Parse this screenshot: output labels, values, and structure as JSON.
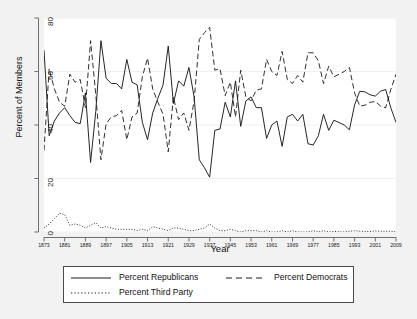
{
  "chart_data": {
    "type": "line",
    "title": "",
    "xlabel": "Year",
    "ylabel": "Percent of Members",
    "xlim": [
      1873,
      2009
    ],
    "ylim": [
      0,
      80
    ],
    "xticks": [
      1873,
      1881,
      1889,
      1897,
      1905,
      1913,
      1921,
      1929,
      1937,
      1945,
      1953,
      1961,
      1969,
      1977,
      1985,
      1993,
      2001,
      2009
    ],
    "yticks": [
      0,
      20,
      40,
      60,
      80
    ],
    "grid": "horizontal",
    "legend_position": "bottom",
    "x": [
      1873,
      1875,
      1877,
      1879,
      1881,
      1883,
      1885,
      1887,
      1889,
      1891,
      1893,
      1895,
      1897,
      1899,
      1901,
      1903,
      1905,
      1907,
      1909,
      1911,
      1913,
      1915,
      1917,
      1919,
      1921,
      1923,
      1925,
      1927,
      1929,
      1931,
      1933,
      1935,
      1937,
      1939,
      1941,
      1943,
      1945,
      1947,
      1949,
      1951,
      1953,
      1955,
      1957,
      1959,
      1961,
      1963,
      1965,
      1967,
      1969,
      1971,
      1973,
      1975,
      1977,
      1979,
      1981,
      1983,
      1985,
      1987,
      1989,
      1991,
      1993,
      1995,
      1997,
      1999,
      2001,
      2003,
      2005,
      2007,
      2009
    ],
    "series": [
      {
        "name": "Percent Republicans",
        "style": "solid",
        "color": "#1a1a1a",
        "values": [
          68.0,
          36.0,
          41.5,
          44.5,
          46.5,
          43.5,
          41.0,
          40.5,
          52.0,
          26.0,
          45.0,
          71.5,
          57.5,
          55.5,
          55.5,
          53.5,
          64.5,
          56.0,
          55.0,
          41.0,
          34.5,
          44.5,
          50.0,
          55.0,
          69.5,
          48.0,
          56.5,
          54.5,
          61.5,
          50.5,
          27.0,
          24.0,
          20.5,
          38.0,
          38.5,
          48.5,
          43.0,
          56.5,
          39.5,
          49.0,
          50.5,
          46.5,
          46.5,
          35.0,
          40.0,
          41.5,
          32.0,
          43.0,
          44.0,
          41.5,
          44.0,
          33.0,
          32.5,
          36.0,
          44.0,
          38.0,
          41.8,
          40.9,
          40.0,
          38.2,
          47.5,
          52.6,
          52.4,
          51.3,
          50.8,
          52.6,
          53.3,
          46.4,
          41.0
        ]
      },
      {
        "name": "Percent Democrats",
        "style": "dashed",
        "color": "#1a1a1a",
        "values": [
          30.5,
          61.0,
          53.5,
          48.5,
          47.0,
          59.0,
          56.0,
          57.0,
          46.5,
          71.5,
          51.5,
          27.0,
          40.5,
          43.0,
          43.5,
          45.5,
          34.5,
          43.0,
          44.5,
          58.0,
          65.0,
          53.5,
          48.5,
          44.0,
          30.0,
          50.5,
          42.0,
          44.5,
          38.0,
          49.0,
          72.0,
          74.5,
          76.5,
          60.5,
          61.0,
          51.0,
          56.0,
          43.0,
          60.5,
          50.5,
          49.0,
          53.0,
          53.5,
          64.5,
          60.0,
          58.5,
          67.5,
          57.0,
          55.5,
          58.5,
          56.0,
          67.0,
          67.0,
          64.0,
          55.5,
          62.0,
          58.0,
          59.0,
          60.0,
          61.5,
          52.0,
          47.1,
          47.4,
          48.5,
          48.8,
          47.1,
          46.4,
          53.3,
          59.0
        ]
      },
      {
        "name": "Percent Third Party",
        "style": "dotted",
        "color": "#1a1a1a",
        "values": [
          1.5,
          3.0,
          5.0,
          7.0,
          6.5,
          2.5,
          3.0,
          2.5,
          1.5,
          2.5,
          3.5,
          1.5,
          2.0,
          1.5,
          1.0,
          1.0,
          1.0,
          1.0,
          0.5,
          1.0,
          0.5,
          2.0,
          1.5,
          1.0,
          0.5,
          1.5,
          1.5,
          1.0,
          0.5,
          0.5,
          1.0,
          1.5,
          3.0,
          1.5,
          0.5,
          0.5,
          1.0,
          0.5,
          0.0,
          0.5,
          0.5,
          0.5,
          0.0,
          0.5,
          0.0,
          0.0,
          0.5,
          0.0,
          0.5,
          0.0,
          0.0,
          0.0,
          0.5,
          0.0,
          0.5,
          0.0,
          0.2,
          0.1,
          0.0,
          0.3,
          0.5,
          0.3,
          0.2,
          0.2,
          0.4,
          0.3,
          0.3,
          0.3,
          0.0
        ]
      }
    ]
  },
  "legend": {
    "items": [
      {
        "label": "Percent Republicans",
        "style": "solid"
      },
      {
        "label": "Percent Democrats",
        "style": "dashed"
      },
      {
        "label": "Percent Third Party",
        "style": "dotted"
      }
    ]
  },
  "colors": {
    "background": "#f2f2f2",
    "plot_background": "#ffffff",
    "line": "#1a1a1a",
    "axis": "#6e6e6e",
    "grid": "#f0f0f0",
    "legend_border": "#4a4a4a"
  }
}
